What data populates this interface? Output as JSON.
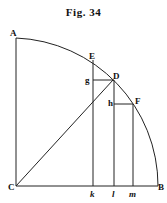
{
  "figure": {
    "title": "Fig. 34",
    "points": {
      "A": "A",
      "B": "B",
      "C": "C",
      "D": "D",
      "E": "E",
      "F": "F",
      "g": "g",
      "h": "h",
      "k": "k",
      "l": "l",
      "m": "m"
    }
  }
}
